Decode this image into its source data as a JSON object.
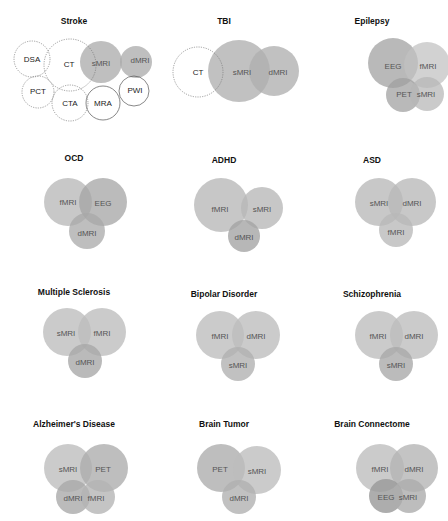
{
  "figure": {
    "panels": [
      {
        "title": "Stroke",
        "modalities": [
          {
            "label": "DSA",
            "style": "outline-dotted"
          },
          {
            "label": "CT",
            "style": "outline-dotted"
          },
          {
            "label": "sMRI",
            "style": "filled"
          },
          {
            "label": "dMRI",
            "style": "filled"
          },
          {
            "label": "PCT",
            "style": "outline-dotted"
          },
          {
            "label": "CTA",
            "style": "outline-dotted"
          },
          {
            "label": "MRA",
            "style": "outline-solid"
          },
          {
            "label": "PWI",
            "style": "outline-solid"
          }
        ]
      },
      {
        "title": "TBI",
        "modalities": [
          {
            "label": "CT",
            "style": "outline-dotted"
          },
          {
            "label": "sMRI",
            "style": "filled"
          },
          {
            "label": "dMRI",
            "style": "filled"
          }
        ]
      },
      {
        "title": "Epilepsy",
        "modalities": [
          {
            "label": "EEG",
            "style": "filled"
          },
          {
            "label": "fMRI",
            "style": "filled"
          },
          {
            "label": "PET",
            "style": "filled"
          },
          {
            "label": "sMRI",
            "style": "filled"
          }
        ]
      },
      {
        "title": "OCD",
        "modalities": [
          {
            "label": "fMRI",
            "style": "filled"
          },
          {
            "label": "EEG",
            "style": "filled"
          },
          {
            "label": "dMRI",
            "style": "filled"
          }
        ]
      },
      {
        "title": "ADHD",
        "modalities": [
          {
            "label": "fMRI",
            "style": "filled"
          },
          {
            "label": "sMRI",
            "style": "filled"
          },
          {
            "label": "dMRI",
            "style": "filled"
          }
        ]
      },
      {
        "title": "ASD",
        "modalities": [
          {
            "label": "sMRI",
            "style": "filled"
          },
          {
            "label": "dMRI",
            "style": "filled"
          },
          {
            "label": "fMRI",
            "style": "filled"
          }
        ]
      },
      {
        "title": "Multiple Sclerosis",
        "modalities": [
          {
            "label": "sMRI",
            "style": "filled"
          },
          {
            "label": "fMRI",
            "style": "filled"
          },
          {
            "label": "dMRI",
            "style": "filled"
          }
        ]
      },
      {
        "title": "Bipolar Disorder",
        "modalities": [
          {
            "label": "fMRI",
            "style": "filled"
          },
          {
            "label": "dMRI",
            "style": "filled"
          },
          {
            "label": "sMRI",
            "style": "filled"
          }
        ]
      },
      {
        "title": "Schizophrenia",
        "modalities": [
          {
            "label": "fMRI",
            "style": "filled"
          },
          {
            "label": "dMRI",
            "style": "filled"
          },
          {
            "label": "sMRI",
            "style": "filled"
          }
        ]
      },
      {
        "title": "Alzheimer's Disease",
        "modalities": [
          {
            "label": "sMRI",
            "style": "filled"
          },
          {
            "label": "PET",
            "style": "filled"
          },
          {
            "label": "dMRI",
            "style": "filled"
          },
          {
            "label": "fMRI",
            "style": "filled"
          }
        ]
      },
      {
        "title": "Brain Tumor",
        "modalities": [
          {
            "label": "PET",
            "style": "filled"
          },
          {
            "label": "sMRI",
            "style": "filled"
          },
          {
            "label": "dMRI",
            "style": "filled"
          }
        ]
      },
      {
        "title": "Brain Connectome",
        "modalities": [
          {
            "label": "fMRI",
            "style": "filled"
          },
          {
            "label": "dMRI",
            "style": "filled"
          },
          {
            "label": "EEG",
            "style": "filled"
          },
          {
            "label": "sMRI",
            "style": "filled"
          }
        ]
      }
    ]
  },
  "colors": {
    "background": "#ffffff",
    "fill_light": "#b9b9b9",
    "fill_mid": "#a8a8a8",
    "fill_dark": "#999999",
    "outline": "#777777",
    "title": "#111111",
    "label": "#555555"
  }
}
